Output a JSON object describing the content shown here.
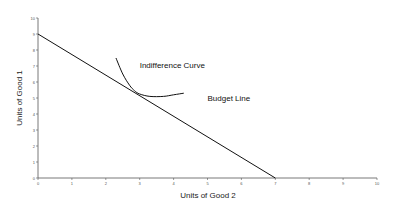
{
  "chart_data": {
    "type": "line",
    "title": "",
    "xlabel": "Units of Good 2",
    "ylabel": "Units of Good 1",
    "xlim": [
      0,
      10
    ],
    "ylim": [
      0,
      10
    ],
    "x_ticks": [
      0,
      1,
      2,
      3,
      4,
      5,
      6,
      7,
      8,
      9,
      10
    ],
    "y_ticks": [
      0,
      1,
      2,
      3,
      4,
      5,
      6,
      7,
      8,
      9,
      10
    ],
    "grid": false,
    "legend": null,
    "series": [
      {
        "name": "Budget Line",
        "type": "line",
        "x": [
          0,
          7
        ],
        "y": [
          9,
          0
        ]
      },
      {
        "name": "Indifference Curve",
        "type": "curve",
        "x": [
          2.3,
          2.5,
          2.7,
          2.85,
          3.0,
          3.3,
          3.7,
          4.0,
          4.3
        ],
        "y": [
          7.5,
          6.5,
          5.8,
          5.45,
          5.25,
          5.1,
          5.1,
          5.2,
          5.3
        ]
      }
    ],
    "annotations": [
      {
        "text": "Indifference Curve",
        "x": 3.0,
        "y": 6.9
      },
      {
        "text": "Budget Line",
        "x": 5.0,
        "y": 4.8
      }
    ],
    "tangent_point": {
      "x": 2.9,
      "y": 5.3
    }
  }
}
